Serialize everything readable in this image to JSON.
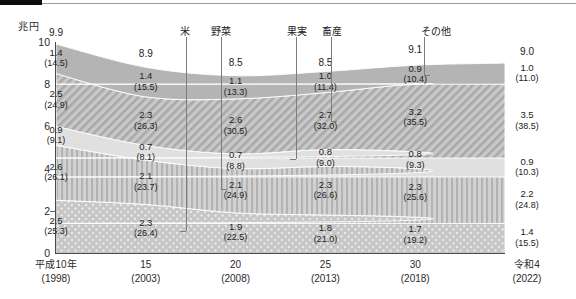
{
  "unit_label": "兆円",
  "axis": {
    "y_ticks": [
      "0",
      "2",
      "4",
      "6",
      "8",
      "10"
    ],
    "y_min": 0,
    "y_max": 10,
    "x_labels": [
      {
        "era": "平成10年",
        "year": "(1998)"
      },
      {
        "era": "15",
        "year": "(2003)"
      },
      {
        "era": "20",
        "year": "(2008)"
      },
      {
        "era": "25",
        "year": "(2013)"
      },
      {
        "era": "30",
        "year": "(2018)"
      },
      {
        "era": "令和4",
        "year": "(2022)"
      }
    ]
  },
  "callouts": [
    {
      "name": "rice",
      "label": "米"
    },
    {
      "name": "vegetables",
      "label": "野菜"
    },
    {
      "name": "fruit",
      "label": "果実"
    },
    {
      "name": "livestock",
      "label": "畜産"
    },
    {
      "name": "other",
      "label": "その他"
    }
  ],
  "chart_data": {
    "type": "area",
    "title": "",
    "xlabel": "",
    "ylabel": "兆円",
    "ylim": [
      0,
      10
    ],
    "grid": false,
    "legend": "callout-lines",
    "categories": [
      "平成10年(1998)",
      "15(2003)",
      "20(2008)",
      "25(2013)",
      "30(2018)",
      "令和4(2022)"
    ],
    "totals": [
      9.9,
      8.9,
      8.5,
      8.5,
      9.1,
      9.0
    ],
    "series": [
      {
        "name": "米",
        "values": [
          2.5,
          2.3,
          1.9,
          1.8,
          1.7,
          1.4
        ],
        "percents": [
          25.3,
          26.4,
          22.5,
          21.0,
          19.2,
          15.5
        ],
        "pattern": "dots",
        "color": "#bdbdbd",
        "order": 1
      },
      {
        "name": "野菜",
        "values": [
          2.6,
          2.1,
          2.1,
          2.3,
          2.3,
          2.2
        ],
        "percents": [
          26.1,
          23.7,
          24.9,
          26.6,
          25.6,
          24.8
        ],
        "pattern": "vertical-stripes",
        "color": "#c4c4c4",
        "order": 2
      },
      {
        "name": "果実",
        "values": [
          0.9,
          0.7,
          0.7,
          0.8,
          0.8,
          0.9
        ],
        "percents": [
          9.1,
          8.1,
          8.8,
          9.0,
          9.3,
          10.3
        ],
        "pattern": "solid-light",
        "color": "#dedede",
        "order": 3
      },
      {
        "name": "畜産",
        "values": [
          2.5,
          2.3,
          2.6,
          2.7,
          3.2,
          3.5
        ],
        "percents": [
          24.9,
          26.3,
          30.5,
          32.0,
          35.5,
          38.5
        ],
        "pattern": "diagonal-hatch",
        "color": "#b5b5b5",
        "order": 4
      },
      {
        "name": "その他",
        "values": [
          1.4,
          1.4,
          1.1,
          1.0,
          0.9,
          1.0
        ],
        "percents": [
          14.5,
          15.5,
          13.3,
          11.4,
          10.4,
          11.0
        ],
        "pattern": "solid-gray",
        "color": "#b0b0b0",
        "order": 5
      }
    ]
  }
}
